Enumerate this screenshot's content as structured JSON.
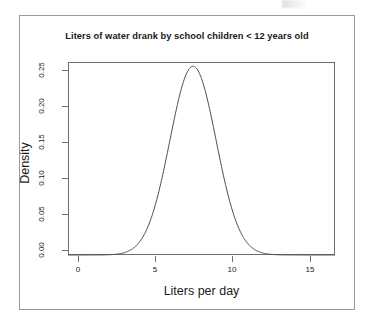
{
  "chart_data": {
    "type": "line",
    "title": "Liters of water drank by school children < 12 years old",
    "xlabel": "Liters per day",
    "ylabel": "Density",
    "xlim": [
      -0.6,
      16.7
    ],
    "ylim": [
      0,
      0.272
    ],
    "grid": false,
    "legend": null,
    "xticks": [
      "0",
      "5",
      "10",
      "15"
    ],
    "xtick_values": [
      0,
      5,
      10,
      15
    ],
    "yticks": [
      "0.00",
      "0.05",
      "0.10",
      "0.15",
      "0.20",
      "0.25"
    ],
    "ytick_values": [
      0.0,
      0.05,
      0.1,
      0.15,
      0.2,
      0.25
    ],
    "distribution": {
      "kind": "normal-density",
      "mean": 7.5,
      "sd": 1.5,
      "peak_density": 0.266,
      "peak_x": 7.5
    },
    "series": [
      {
        "name": "Density",
        "color": "#4d4d4d",
        "x": [
          -0.6,
          0.0,
          0.5,
          1.0,
          1.5,
          2.0,
          2.5,
          3.0,
          3.5,
          4.0,
          4.5,
          5.0,
          5.5,
          6.0,
          6.5,
          7.0,
          7.5,
          8.0,
          8.5,
          9.0,
          9.5,
          10.0,
          10.5,
          11.0,
          11.5,
          12.0,
          12.5,
          13.0,
          13.5,
          14.0,
          15.0,
          16.0,
          16.7
        ],
        "values": [
          0.0,
          0.0,
          0.0,
          0.0001,
          0.0002,
          0.0007,
          0.0019,
          0.0045,
          0.0099,
          0.0197,
          0.0355,
          0.0576,
          0.0843,
          0.1109,
          0.1353,
          0.1546,
          0.1664,
          0.1546,
          0.1353,
          0.1109,
          0.0843,
          0.0576,
          0.0355,
          0.0197,
          0.0099,
          0.0045,
          0.0019,
          0.0007,
          0.0002,
          0.0001,
          0.0,
          0.0,
          0.0
        ]
      }
    ]
  },
  "figure": {
    "title": "Liters of water drank by school children < 12 years old",
    "x_axis_title": "Liters per day",
    "y_axis_title": "Density",
    "background_color": "#ffffff",
    "frame_color": "#9a9a9a",
    "axis_color": "#6e6e6e",
    "curve_color": "#4d4d4d"
  }
}
